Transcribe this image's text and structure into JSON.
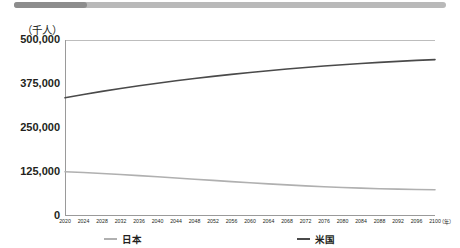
{
  "topbar": {
    "name": "horizontal-scrollbar",
    "track_color": "#b9b9b9",
    "thumb_color": "#8d8d8d",
    "thumb_position_pct": 0,
    "thumb_width_pct": 17
  },
  "chart_data": {
    "type": "line",
    "title": "",
    "unit_label": "（千人）",
    "xlabel": "（年）",
    "ylabel": "",
    "ylim": [
      0,
      500000
    ],
    "xlim": [
      2020,
      2100
    ],
    "grid": false,
    "legend_position": "bottom",
    "ytick_labels": [
      "500,000",
      "375,000",
      "250,000",
      "125,000",
      "0"
    ],
    "ytick_values": [
      500000,
      375000,
      250000,
      125000,
      0
    ],
    "x": [
      2020,
      2024,
      2028,
      2032,
      2036,
      2040,
      2044,
      2048,
      2052,
      2056,
      2060,
      2064,
      2068,
      2072,
      2076,
      2080,
      2084,
      2088,
      2092,
      2096,
      2100
    ],
    "xtick_labels": [
      "2020",
      "2024",
      "2028",
      "2032",
      "2036",
      "2040",
      "2044",
      "2048",
      "2052",
      "2056",
      "2060",
      "2064",
      "2068",
      "2072",
      "2076",
      "2080",
      "2084",
      "2088",
      "2092",
      "2096",
      "2100"
    ],
    "series": [
      {
        "name": "日本",
        "color": "#b0b0b0",
        "values": [
          125800,
          123500,
          120800,
          117800,
          114600,
          111300,
          107900,
          104500,
          101100,
          97700,
          94400,
          91300,
          88400,
          85700,
          83300,
          81100,
          79200,
          77600,
          76300,
          75300,
          74600
        ]
      },
      {
        "name": "米国",
        "color": "#4a4a4a",
        "values": [
          335900,
          345200,
          354000,
          362200,
          369900,
          377200,
          384100,
          390600,
          396700,
          402400,
          407800,
          412800,
          417500,
          421900,
          426000,
          429800,
          433300,
          436500,
          439400,
          442000,
          444300
        ]
      }
    ]
  },
  "legend": {
    "items": [
      {
        "label": "日本",
        "color": "#b0b0b0"
      },
      {
        "label": "米国",
        "color": "#4a4a4a"
      }
    ]
  }
}
